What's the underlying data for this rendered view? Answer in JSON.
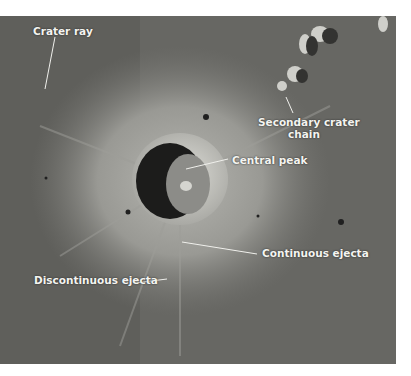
{
  "figure": {
    "labels": [
      {
        "id": "crater-ray",
        "text": "Crater ray"
      },
      {
        "id": "secondary-crater-chain",
        "line1": "Secondary crater",
        "line2": "chain"
      },
      {
        "id": "central-peak",
        "text": "Central peak"
      },
      {
        "id": "continuous-ejecta",
        "text": "Continuous ejecta"
      },
      {
        "id": "discontinuous-ejecta",
        "text": "Discontinuous ejecta"
      }
    ]
  }
}
